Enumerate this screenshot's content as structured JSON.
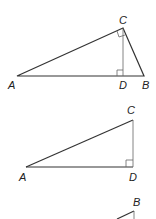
{
  "figure1": {
    "labels": {
      "A": "A",
      "B": "B",
      "C": "C",
      "D": "D"
    },
    "description": "Right triangle ABC with right angle at C and altitude CD to hypotenuse AB"
  },
  "figure2": {
    "labels": {
      "A": "A",
      "C": "C",
      "D": "D"
    },
    "description": "Right triangle ACD with right angle at D"
  },
  "figure3": {
    "labels": {
      "B": "B"
    },
    "description": "Partial triangle BCD (cropped)"
  },
  "colors": {
    "stroke": "#333333",
    "thin_stroke": "#555555",
    "text": "#222222"
  }
}
